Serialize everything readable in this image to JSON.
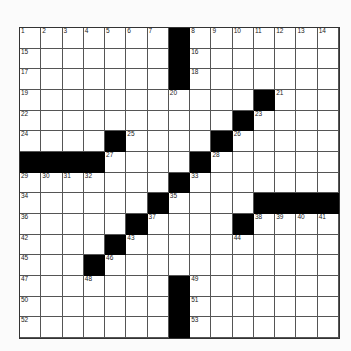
{
  "puzzle": {
    "rows": 15,
    "cols": 15,
    "layout": [
      "#######B#######",
      "#######B#######",
      "#######B#######",
      "###########B###",
      "##########B####",
      "####B####B#####",
      "BBBB####B######",
      "#######B#######",
      "######B####BBBB",
      "#####B####B####",
      "####B##########",
      "###B###########",
      "#######B#######",
      "#######B#######",
      "#######B#######"
    ],
    "numbers": {
      "0,0": "1",
      "0,1": "2",
      "0,2": "3",
      "0,3": "4",
      "0,4": "5",
      "0,5": "6",
      "0,6": "7",
      "0,8": "8",
      "0,9": "9",
      "0,10": "10",
      "0,11": "11",
      "0,12": "12",
      "0,13": "13",
      "0,14": "14",
      "1,0": "15",
      "1,8": "16",
      "2,0": "17",
      "2,8": "18",
      "3,0": "19",
      "3,7": "20",
      "3,12": "21",
      "4,0": "22",
      "4,11": "23",
      "5,0": "24",
      "5,5": "25",
      "5,10": "26",
      "6,4": "27",
      "6,9": "28",
      "7,0": "29",
      "7,1": "30",
      "7,2": "31",
      "7,3": "32",
      "7,8": "33",
      "8,0": "34",
      "8,7": "35",
      "9,0": "36",
      "9,6": "37",
      "9,11": "38",
      "9,12": "39",
      "9,13": "40",
      "9,14": "41",
      "10,0": "42",
      "10,5": "43",
      "10,10": "44",
      "11,0": "45",
      "11,4": "46",
      "12,0": "47",
      "12,3": "48",
      "12,8": "49",
      "13,0": "50",
      "13,8": "51",
      "14,0": "52",
      "14,8": "53"
    }
  }
}
